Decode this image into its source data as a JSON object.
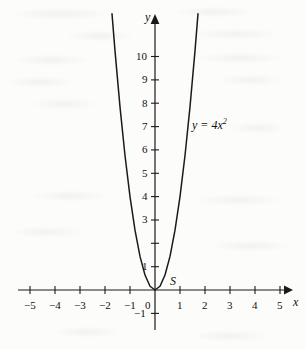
{
  "figure": {
    "kind": "cartesian-plot",
    "background_color": "#fcfcfb",
    "ink_color": "#1a1a1a"
  },
  "chart_data": {
    "type": "line",
    "title": "",
    "subtitle": "",
    "xlabel": "x",
    "ylabel": "y",
    "equation_label": "y = 4x",
    "equation_exponent": "2",
    "function": "y = 4x^2",
    "grid": false,
    "legend": "none",
    "xlim": [
      -5.5,
      5.5
    ],
    "ylim": [
      -1.5,
      11.9
    ],
    "xticks": [
      -5,
      -4,
      -3,
      -2,
      -1,
      0,
      1,
      2,
      3,
      4,
      5
    ],
    "xticklabels": [
      "−5",
      "−4",
      "−3",
      "−2",
      "−1",
      "0",
      "1",
      "2",
      "3",
      "4",
      "5"
    ],
    "yticks": [
      -1,
      1,
      2,
      3,
      4,
      5,
      6,
      7,
      8,
      9,
      10
    ],
    "yticklabels": [
      "−1",
      "1",
      "2",
      "3",
      "4",
      "5",
      "6",
      "7",
      "8",
      "9",
      "10"
    ],
    "ytick_labeled": [
      -1,
      1,
      3,
      4,
      5,
      6,
      7,
      8,
      9,
      10
    ],
    "x": [
      -1.72,
      -1.6,
      -1.4,
      -1.2,
      -1.0,
      -0.8,
      -0.6,
      -0.4,
      -0.2,
      0,
      0.2,
      0.4,
      0.6,
      0.8,
      1.0,
      1.2,
      1.4,
      1.6,
      1.72
    ],
    "y": [
      11.83,
      10.24,
      7.84,
      5.76,
      4.0,
      2.56,
      1.44,
      0.64,
      0.16,
      0,
      0.16,
      0.64,
      1.44,
      2.56,
      4.0,
      5.76,
      7.84,
      10.24,
      11.83
    ],
    "annotations": [
      {
        "text": "S",
        "x": 0.45,
        "y": 0.85,
        "style": "italic",
        "meaning": "vertex-label"
      }
    ],
    "axis_arrows": {
      "x_positive": true,
      "y_positive": true
    }
  },
  "labels": {
    "y_axis": "y",
    "x_axis": "x",
    "vertex": "S",
    "equation_lhs": "y = 4x",
    "equation_exp": "2"
  }
}
